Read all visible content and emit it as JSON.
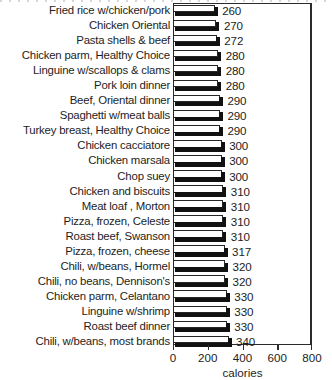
{
  "chart_data": {
    "type": "bar",
    "orientation": "horizontal",
    "title": "",
    "subtitle": "",
    "xlabel": "calories",
    "ylabel": "",
    "xlim": [
      0,
      800
    ],
    "xticks": [
      0,
      200,
      400,
      600,
      800
    ],
    "xtick_labels": [
      "0",
      "200",
      "400",
      "600",
      "800"
    ],
    "grid": false,
    "legend": null,
    "value_labels_shown": true,
    "categories": [
      "Fried rice w/chicken/pork",
      "Chicken Oriental",
      "Pasta shells & beef",
      "Chicken parm, Healthy Choice",
      "Linguine w/scallops & clams",
      "Pork loin dinner",
      "Beef, Oriental dinner",
      "Spaghetti w/meat balls",
      "Turkey breast, Healthy Choice",
      "Chicken cacciatore",
      "Chicken marsala",
      "Chop suey",
      "Chicken and biscuits",
      "Meat loaf , Morton",
      "Pizza, frozen, Celeste",
      "Roast beef, Swanson",
      "Pizza, frozen, cheese",
      "Chili, w/beans, Hormel",
      "Chili, no beans, Dennison's",
      "Chicken parm, Celantano",
      "Linguine w/shrimp",
      "Roast beef dinner",
      "Chili, w/beans, most brands"
    ],
    "values": [
      260,
      270,
      272,
      280,
      280,
      280,
      290,
      290,
      290,
      300,
      300,
      300,
      310,
      310,
      310,
      310,
      317,
      320,
      320,
      330,
      330,
      330,
      340
    ],
    "value_labels": [
      "260",
      "270",
      "272",
      "280",
      "280",
      "280",
      "290",
      "290",
      "290",
      "300",
      "300",
      "300",
      "310",
      "310",
      "310",
      "310",
      "317",
      "320",
      "320",
      "330",
      "330",
      "330",
      "340"
    ]
  },
  "style": {
    "bar_face_color": "#ffffff",
    "bar_outline_color": "#262626",
    "bar_shadow_color": "#111111",
    "frame_color": "#2b2b2b",
    "text_color": "#1d1d1d",
    "background_color": "#ffffff"
  }
}
